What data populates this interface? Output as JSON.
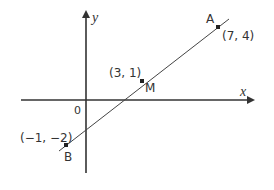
{
  "diagram": {
    "type": "coordinate-geometry",
    "axes": {
      "x_label": "x",
      "y_label": "y",
      "origin_label": "0"
    },
    "points": [
      {
        "name": "A",
        "coords": "(7, 4)"
      },
      {
        "name": "M",
        "coords": "(3, 1)"
      },
      {
        "name": "B",
        "coords": "(−1, −2)"
      }
    ],
    "segment": "AB",
    "colors": {
      "line": "#444444",
      "axes": "#333333",
      "text": "#333333",
      "background": "#ffffff"
    }
  }
}
